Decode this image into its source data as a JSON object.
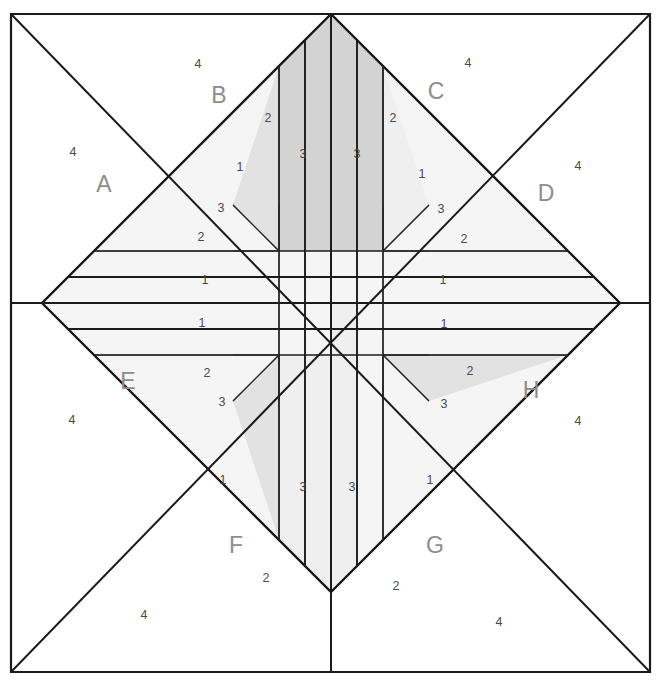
{
  "diagram": {
    "kind": "quilt-block-piecing-diagram",
    "canvas": {
      "width": 656,
      "height": 685
    },
    "geometry": {
      "border": {
        "left": 11,
        "top": 14,
        "right": 650,
        "bottom": 672
      },
      "center": {
        "x": 331,
        "y": 303
      },
      "diamond_points": {
        "top": {
          "x": 331,
          "y": 14
        },
        "right": {
          "x": 568,
          "y": 303
        },
        "bottom": {
          "x": 331,
          "y": 672
        },
        "left": {
          "x": 102,
          "y": 303
        }
      },
      "strip_half_width": 26,
      "inner_step": 52
    },
    "colors": {
      "background": "#ffffff",
      "line": "#1b1b1b",
      "thin_line": "#2b2b2b",
      "shade_dark": "#d3d3d3",
      "shade_mid": "#e2e2e2",
      "shade_light": "#efefef",
      "shade_lightest": "#f5f5f5",
      "number_text": "#4a4a4a",
      "section_text": "#8d8d8d"
    },
    "sections": [
      {
        "id": "A",
        "label": "A",
        "x": 104,
        "y": 186,
        "corner_label": "4",
        "corner_x": 73,
        "corner_y": 153
      },
      {
        "id": "B",
        "label": "B",
        "x": 219,
        "y": 97,
        "corner_label": "4",
        "corner_x": 198,
        "corner_y": 65
      },
      {
        "id": "C",
        "label": "C",
        "x": 436,
        "y": 93,
        "corner_label": "4",
        "corner_x": 468,
        "corner_y": 64
      },
      {
        "id": "D",
        "label": "D",
        "x": 546,
        "y": 195,
        "corner_label": "4",
        "corner_x": 578,
        "corner_y": 167
      },
      {
        "id": "E",
        "label": "E",
        "x": 128,
        "y": 383,
        "corner_label": "4",
        "corner_x": 72,
        "corner_y": 421
      },
      {
        "id": "F",
        "label": "F",
        "x": 236,
        "y": 547,
        "corner_label": "4",
        "corner_x": 144,
        "corner_y": 616
      },
      {
        "id": "G",
        "label": "G",
        "x": 435,
        "y": 547,
        "corner_label": "4",
        "corner_x": 499,
        "corner_y": 623
      },
      {
        "id": "H",
        "label": "H",
        "x": 531,
        "y": 392,
        "corner_label": "4",
        "corner_x": 578,
        "corner_y": 422
      }
    ],
    "piece_labels": [
      {
        "text": "1",
        "x": 205,
        "y": 281,
        "section": "A",
        "piece": 1
      },
      {
        "text": "2",
        "x": 201,
        "y": 238,
        "section": "A",
        "piece": 2
      },
      {
        "text": "3",
        "x": 221,
        "y": 209,
        "section": "A",
        "piece": 3
      },
      {
        "text": "1",
        "x": 240,
        "y": 168,
        "section": "B",
        "piece": 1
      },
      {
        "text": "2",
        "x": 268,
        "y": 119,
        "section": "B",
        "piece": 2
      },
      {
        "text": "3",
        "x": 303,
        "y": 155,
        "section": "B",
        "piece": 3
      },
      {
        "text": "3",
        "x": 357,
        "y": 155,
        "section": "C",
        "piece": 3
      },
      {
        "text": "2",
        "x": 393,
        "y": 119,
        "section": "C",
        "piece": 2
      },
      {
        "text": "1",
        "x": 422,
        "y": 175,
        "section": "C",
        "piece": 1
      },
      {
        "text": "3",
        "x": 441,
        "y": 210,
        "section": "D",
        "piece": 3
      },
      {
        "text": "2",
        "x": 464,
        "y": 240,
        "section": "D",
        "piece": 2
      },
      {
        "text": "1",
        "x": 443,
        "y": 281,
        "section": "D",
        "piece": 1
      },
      {
        "text": "1",
        "x": 202,
        "y": 324,
        "section": "E",
        "piece": 1
      },
      {
        "text": "2",
        "x": 207,
        "y": 374,
        "section": "E",
        "piece": 2
      },
      {
        "text": "3",
        "x": 222,
        "y": 403,
        "section": "E",
        "piece": 3
      },
      {
        "text": "1",
        "x": 223,
        "y": 481,
        "section": "F",
        "piece": 1
      },
      {
        "text": "3",
        "x": 303,
        "y": 488,
        "section": "F",
        "piece": 3
      },
      {
        "text": "2",
        "x": 266,
        "y": 579,
        "section": "F",
        "piece": 2
      },
      {
        "text": "2",
        "x": 396,
        "y": 587,
        "section": "G",
        "piece": 2
      },
      {
        "text": "3",
        "x": 352,
        "y": 488,
        "section": "G",
        "piece": 3
      },
      {
        "text": "1",
        "x": 430,
        "y": 481,
        "section": "G",
        "piece": 1
      },
      {
        "text": "3",
        "x": 444,
        "y": 405,
        "section": "H",
        "piece": 3
      },
      {
        "text": "2",
        "x": 470,
        "y": 372,
        "section": "H",
        "piece": 2
      },
      {
        "text": "1",
        "x": 444,
        "y": 325,
        "section": "H",
        "piece": 1
      }
    ]
  }
}
